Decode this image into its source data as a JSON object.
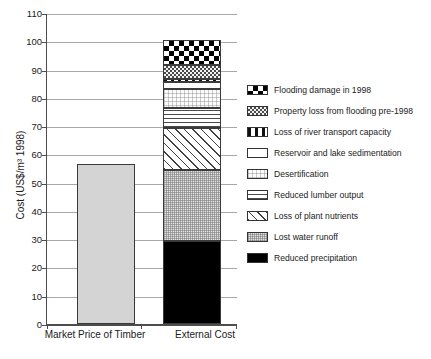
{
  "chart_data": {
    "type": "bar",
    "subtype": "stacked-bar",
    "title": "",
    "xlabel": "",
    "ylabel": "Cost (US$/m³ 1998)",
    "ylim": [
      0,
      110
    ],
    "ytick_step": 10,
    "yticks": [
      "0",
      "10",
      "20",
      "30",
      "40",
      "50",
      "60",
      "70",
      "80",
      "90",
      "100",
      "110"
    ],
    "grid": true,
    "legend_position": "right",
    "categories": [
      "Market Price of Timber",
      "External Cost"
    ],
    "series": [
      {
        "name": "Reduced precipitation",
        "values": [
          0,
          29.5
        ],
        "pattern": "solid-black",
        "color": "#000000"
      },
      {
        "name": "Lost water runoff",
        "values": [
          0,
          25.0
        ],
        "pattern": "stipple",
        "color": "#e3e3e3"
      },
      {
        "name": "Loss of plant nutrients",
        "values": [
          0,
          15.0
        ],
        "pattern": "diagonal-hatch",
        "color": "#ffffff"
      },
      {
        "name": "Reduced lumber output",
        "values": [
          0,
          7.0
        ],
        "pattern": "horizontal-lines",
        "color": "#ffffff"
      },
      {
        "name": "Desertification",
        "values": [
          0,
          6.5
        ],
        "pattern": "faint-dots",
        "color": "#fbfbfb"
      },
      {
        "name": "Reservoir and lake sedimentation",
        "values": [
          0,
          2.5
        ],
        "pattern": "white",
        "color": "#ffffff"
      },
      {
        "name": "Loss of river transport capacity",
        "values": [
          0,
          1.0
        ],
        "pattern": "dash-dot",
        "color": "#ffffff"
      },
      {
        "name": "Property loss from flooding pre-1998",
        "values": [
          0,
          5.0
        ],
        "pattern": "fine-checker",
        "color": "#6a6a6a"
      },
      {
        "name": "Flooding damage in 1998",
        "values": [
          0,
          9.0
        ],
        "pattern": "bold-checker",
        "color": "#000000"
      }
    ],
    "single_bars": [
      {
        "name": "Market Price of Timber",
        "value": 56.5,
        "pattern": "light-gray",
        "color": "#d4d4d4"
      }
    ],
    "totals": [
      56.5,
      100.5
    ],
    "segment_tops_external": [
      29.5,
      54.5,
      69.5,
      76.5,
      83.0,
      85.5,
      86.5,
      91.5,
      100.5
    ]
  },
  "legend": {
    "items": [
      {
        "label": "Flooding damage in 1998",
        "swatch": "bold-checker"
      },
      {
        "label": "Property loss from flooding pre-1998",
        "swatch": "fine-checker"
      },
      {
        "label": "Loss of river transport capacity",
        "swatch": "dash-dot"
      },
      {
        "label": "Reservoir and lake sedimentation",
        "swatch": "white"
      },
      {
        "label": "Desertification",
        "swatch": "faint-dots"
      },
      {
        "label": "Reduced lumber output",
        "swatch": "horizontal-lines"
      },
      {
        "label": "Loss of plant nutrients",
        "swatch": "diagonal-hatch"
      },
      {
        "label": "Lost water runoff",
        "swatch": "stipple"
      },
      {
        "label": "Reduced precipitation",
        "swatch": "solid-black"
      }
    ]
  }
}
